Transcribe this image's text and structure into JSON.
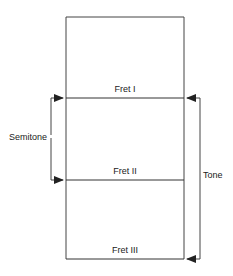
{
  "diagram": {
    "type": "guitar-fret-intervals",
    "frets": [
      {
        "label": "Fret I"
      },
      {
        "label": "Fret II"
      },
      {
        "label": "Fret III"
      }
    ],
    "brackets": {
      "semitone": {
        "label": "Semitone",
        "from": "Fret I",
        "to": "Fret II",
        "side": "left"
      },
      "tone": {
        "label": "Tone",
        "from": "Fret I",
        "to": "Fret III",
        "side": "right"
      }
    },
    "colors": {
      "line": "#333333",
      "text": "#222222",
      "background": "#ffffff"
    }
  }
}
